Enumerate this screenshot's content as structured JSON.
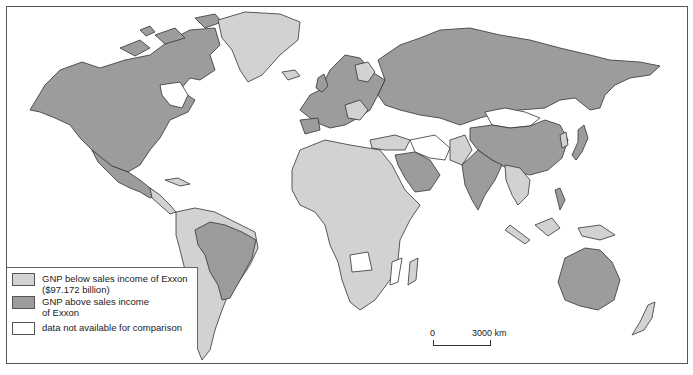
{
  "map": {
    "type": "choropleth world map",
    "colors": {
      "below": "#d2d2d2",
      "above": "#9c9c9c",
      "na": "#ffffff",
      "border": "#333333"
    }
  },
  "legend": {
    "items": [
      {
        "label_line1": "GNP below sales income of Exxon",
        "label_line2": "($97.172 billion)",
        "color": "#d2d2d2"
      },
      {
        "label_line1": "GNP above sales income",
        "label_line2": "of Exxon",
        "color": "#9c9c9c"
      },
      {
        "label_line1": "data not available for comparison",
        "label_line2": "",
        "color": "#ffffff"
      }
    ]
  },
  "scale": {
    "start_label": "0",
    "end_label": "3000 km"
  }
}
